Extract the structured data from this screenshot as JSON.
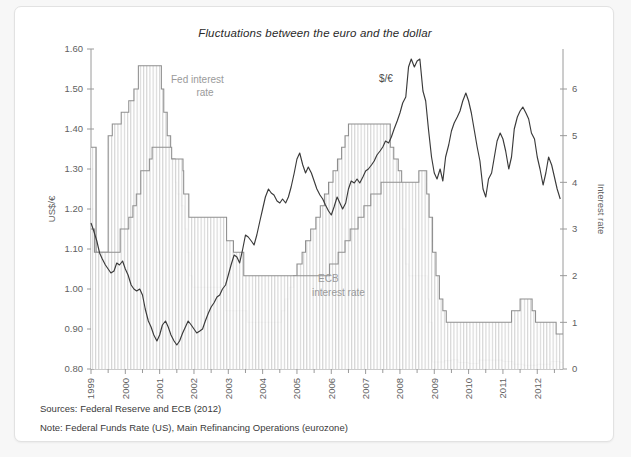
{
  "card": {
    "title": "Fluctuations between the euro and the dollar",
    "source_note": "Sources: Federal Reserve and ECB (2012)",
    "method_note": "Note: Federal Funds Rate (US), Main Refinancing Operations (eurozone)"
  },
  "annotations": {
    "fed_label_line1": "Fed interest",
    "fed_label_line2": "rate",
    "ecb_label_line1": "ECB",
    "ecb_label_line2": "interest rate",
    "fx_label": "$/€"
  },
  "chart_data": {
    "type": "line",
    "title": "Fluctuations between the euro and the dollar",
    "xlabel": "",
    "ylabel": "US$/€",
    "y2label": "Interest rate",
    "xlim": [
      1999.0,
      2012.75
    ],
    "ylim": [
      0.8,
      1.6
    ],
    "y2lim": [
      0,
      6
    ],
    "grid": false,
    "legend_position": "inline-annotations",
    "x_ticks": [
      "1999",
      "2000",
      "2001",
      "2002",
      "2003",
      "2004",
      "2005",
      "2006",
      "2007",
      "2008",
      "2009",
      "2010",
      "2011",
      "2012"
    ],
    "x_tick_values": [
      1999,
      2000,
      2001,
      2002,
      2003,
      2004,
      2005,
      2006,
      2007,
      2008,
      2009,
      2010,
      2011,
      2012
    ],
    "x_minor_ticks": [
      1999.5,
      2000.5,
      2001.5,
      2002.5,
      2003.5,
      2004.5,
      2005.5,
      2006.5,
      2007.5,
      2008.5,
      2009.5,
      2010.5,
      2011.5,
      2012.5
    ],
    "y_ticks": [
      "0.80",
      "0.90",
      "1.00",
      "1.10",
      "1.20",
      "1.30",
      "1.40",
      "1.50",
      "1.60"
    ],
    "y_tick_values": [
      0.8,
      0.9,
      1.0,
      1.1,
      1.2,
      1.3,
      1.4,
      1.5,
      1.6
    ],
    "y2_ticks": [
      "0",
      "1",
      "2",
      "3",
      "4",
      "5",
      "6"
    ],
    "y2_tick_values": [
      0,
      1,
      2,
      3,
      4,
      5,
      6
    ],
    "series": [
      {
        "name": "$/€ exchange rate",
        "axis": "left",
        "style": "line",
        "color": "#3a3a3a",
        "units": "US$ per euro",
        "x": [
          1999.0,
          1999.08,
          1999.17,
          1999.25,
          1999.33,
          1999.42,
          1999.5,
          1999.58,
          1999.67,
          1999.75,
          1999.83,
          1999.92,
          2000.0,
          2000.08,
          2000.17,
          2000.25,
          2000.33,
          2000.42,
          2000.5,
          2000.58,
          2000.67,
          2000.75,
          2000.83,
          2000.92,
          2001.0,
          2001.08,
          2001.17,
          2001.25,
          2001.33,
          2001.42,
          2001.5,
          2001.58,
          2001.67,
          2001.75,
          2001.83,
          2001.92,
          2002.0,
          2002.08,
          2002.17,
          2002.25,
          2002.33,
          2002.42,
          2002.5,
          2002.58,
          2002.67,
          2002.75,
          2002.83,
          2002.92,
          2003.0,
          2003.08,
          2003.17,
          2003.25,
          2003.33,
          2003.42,
          2003.5,
          2003.58,
          2003.67,
          2003.75,
          2003.83,
          2003.92,
          2004.0,
          2004.08,
          2004.17,
          2004.25,
          2004.33,
          2004.42,
          2004.5,
          2004.58,
          2004.67,
          2004.75,
          2004.83,
          2004.92,
          2005.0,
          2005.08,
          2005.17,
          2005.25,
          2005.33,
          2005.42,
          2005.5,
          2005.58,
          2005.67,
          2005.75,
          2005.83,
          2005.92,
          2006.0,
          2006.08,
          2006.17,
          2006.25,
          2006.33,
          2006.42,
          2006.5,
          2006.58,
          2006.67,
          2006.75,
          2006.83,
          2006.92,
          2007.0,
          2007.08,
          2007.17,
          2007.25,
          2007.33,
          2007.42,
          2007.5,
          2007.58,
          2007.67,
          2007.75,
          2007.83,
          2007.92,
          2008.0,
          2008.08,
          2008.17,
          2008.25,
          2008.33,
          2008.42,
          2008.5,
          2008.58,
          2008.67,
          2008.75,
          2008.83,
          2008.92,
          2009.0,
          2009.08,
          2009.17,
          2009.25,
          2009.33,
          2009.42,
          2009.5,
          2009.58,
          2009.67,
          2009.75,
          2009.83,
          2009.92,
          2010.0,
          2010.08,
          2010.17,
          2010.25,
          2010.33,
          2010.42,
          2010.5,
          2010.58,
          2010.67,
          2010.75,
          2010.83,
          2010.92,
          2011.0,
          2011.08,
          2011.17,
          2011.25,
          2011.33,
          2011.42,
          2011.5,
          2011.58,
          2011.67,
          2011.75,
          2011.83,
          2011.92,
          2012.0,
          2012.08,
          2012.17,
          2012.25,
          2012.33,
          2012.42,
          2012.5,
          2012.58,
          2012.67
        ],
        "y": [
          1.165,
          1.145,
          1.12,
          1.09,
          1.075,
          1.06,
          1.05,
          1.04,
          1.045,
          1.065,
          1.06,
          1.07,
          1.05,
          1.035,
          1.01,
          1.0,
          0.995,
          1.0,
          0.985,
          0.95,
          0.92,
          0.905,
          0.885,
          0.87,
          0.885,
          0.91,
          0.92,
          0.905,
          0.885,
          0.87,
          0.86,
          0.87,
          0.89,
          0.905,
          0.92,
          0.91,
          0.9,
          0.89,
          0.895,
          0.9,
          0.92,
          0.94,
          0.955,
          0.965,
          0.98,
          0.985,
          1.0,
          1.01,
          1.035,
          1.06,
          1.085,
          1.08,
          1.065,
          1.1,
          1.135,
          1.13,
          1.12,
          1.11,
          1.135,
          1.17,
          1.2,
          1.23,
          1.25,
          1.24,
          1.235,
          1.22,
          1.215,
          1.225,
          1.215,
          1.23,
          1.255,
          1.29,
          1.325,
          1.34,
          1.31,
          1.29,
          1.305,
          1.29,
          1.27,
          1.25,
          1.235,
          1.225,
          1.21,
          1.195,
          1.185,
          1.205,
          1.23,
          1.215,
          1.2,
          1.215,
          1.25,
          1.27,
          1.265,
          1.275,
          1.265,
          1.28,
          1.295,
          1.3,
          1.31,
          1.32,
          1.335,
          1.345,
          1.355,
          1.37,
          1.365,
          1.38,
          1.4,
          1.42,
          1.44,
          1.465,
          1.48,
          1.555,
          1.575,
          1.555,
          1.57,
          1.575,
          1.495,
          1.47,
          1.4,
          1.33,
          1.29,
          1.275,
          1.3,
          1.27,
          1.33,
          1.36,
          1.395,
          1.415,
          1.43,
          1.445,
          1.47,
          1.49,
          1.47,
          1.44,
          1.395,
          1.355,
          1.32,
          1.25,
          1.23,
          1.275,
          1.29,
          1.33,
          1.37,
          1.39,
          1.375,
          1.345,
          1.3,
          1.33,
          1.4,
          1.43,
          1.445,
          1.455,
          1.44,
          1.425,
          1.39,
          1.375,
          1.33,
          1.3,
          1.26,
          1.29,
          1.33,
          1.31,
          1.28,
          1.25,
          1.225
        ],
        "key_points": {
          "start_1999": 1.165,
          "trough_2001": 0.86,
          "trough_2000_late": 0.87,
          "peak_2008": 1.575,
          "dip_2008_late": 1.255,
          "peak_2009_late": 1.49,
          "dip_2010_mid": 1.23,
          "peak_2011_mid": 1.455,
          "end_2012": 1.225
        }
      },
      {
        "name": "Fed interest rate (Federal Funds Rate, US)",
        "axis": "right",
        "style": "step-area-hatched",
        "color": "#8e8e8e",
        "units": "percent",
        "steps": [
          {
            "x": 1999.0,
            "rate": 4.75
          },
          {
            "x": 1999.1,
            "rate": 4.75
          },
          {
            "x": 1999.15,
            "rate": 2.5
          },
          {
            "x": 1999.45,
            "rate": 2.5
          },
          {
            "x": 1999.5,
            "rate": 5.0
          },
          {
            "x": 1999.62,
            "rate": 5.25
          },
          {
            "x": 1999.88,
            "rate": 5.5
          },
          {
            "x": 2000.1,
            "rate": 5.75
          },
          {
            "x": 2000.25,
            "rate": 6.0
          },
          {
            "x": 2000.38,
            "rate": 6.5
          },
          {
            "x": 2001.0,
            "rate": 6.5
          },
          {
            "x": 2001.05,
            "rate": 6.0
          },
          {
            "x": 2001.12,
            "rate": 5.5
          },
          {
            "x": 2001.22,
            "rate": 5.0
          },
          {
            "x": 2001.32,
            "rate": 4.5
          },
          {
            "x": 2001.45,
            "rate": 4.0
          },
          {
            "x": 2001.5,
            "rate": 3.75
          },
          {
            "x": 2001.62,
            "rate": 3.5
          },
          {
            "x": 2001.72,
            "rate": 3.0
          },
          {
            "x": 2001.8,
            "rate": 2.5
          },
          {
            "x": 2001.88,
            "rate": 2.0
          },
          {
            "x": 2001.95,
            "rate": 1.75
          },
          {
            "x": 2002.9,
            "rate": 1.75
          },
          {
            "x": 2002.92,
            "rate": 1.25
          },
          {
            "x": 2003.5,
            "rate": 1.25
          },
          {
            "x": 2003.55,
            "rate": 1.0
          },
          {
            "x": 2004.5,
            "rate": 1.0
          },
          {
            "x": 2004.55,
            "rate": 1.25
          },
          {
            "x": 2004.65,
            "rate": 1.5
          },
          {
            "x": 2004.78,
            "rate": 1.75
          },
          {
            "x": 2004.9,
            "rate": 2.0
          },
          {
            "x": 2005.0,
            "rate": 2.25
          },
          {
            "x": 2005.15,
            "rate": 2.5
          },
          {
            "x": 2005.25,
            "rate": 2.75
          },
          {
            "x": 2005.4,
            "rate": 3.0
          },
          {
            "x": 2005.55,
            "rate": 3.25
          },
          {
            "x": 2005.68,
            "rate": 3.5
          },
          {
            "x": 2005.8,
            "rate": 3.75
          },
          {
            "x": 2005.92,
            "rate": 4.0
          },
          {
            "x": 2006.05,
            "rate": 4.25
          },
          {
            "x": 2006.18,
            "rate": 4.5
          },
          {
            "x": 2006.3,
            "rate": 4.75
          },
          {
            "x": 2006.4,
            "rate": 5.0
          },
          {
            "x": 2006.5,
            "rate": 5.25
          },
          {
            "x": 2007.68,
            "rate": 5.25
          },
          {
            "x": 2007.72,
            "rate": 4.75
          },
          {
            "x": 2007.82,
            "rate": 4.5
          },
          {
            "x": 2007.95,
            "rate": 4.25
          },
          {
            "x": 2008.05,
            "rate": 3.0
          },
          {
            "x": 2008.15,
            "rate": 2.25
          },
          {
            "x": 2008.25,
            "rate": 2.0
          },
          {
            "x": 2008.75,
            "rate": 2.0
          },
          {
            "x": 2008.8,
            "rate": 1.5
          },
          {
            "x": 2008.85,
            "rate": 1.0
          },
          {
            "x": 2008.95,
            "rate": 0.15
          },
          {
            "x": 2009.3,
            "rate": 0.18
          },
          {
            "x": 2009.5,
            "rate": 0.2
          },
          {
            "x": 2009.7,
            "rate": 0.14
          },
          {
            "x": 2010.0,
            "rate": 0.12
          },
          {
            "x": 2010.3,
            "rate": 0.19
          },
          {
            "x": 2010.6,
            "rate": 0.19
          },
          {
            "x": 2011.0,
            "rate": 0.16
          },
          {
            "x": 2011.3,
            "rate": 0.1
          },
          {
            "x": 2011.6,
            "rate": 0.08
          },
          {
            "x": 2012.0,
            "rate": 0.1
          },
          {
            "x": 2012.4,
            "rate": 0.16
          },
          {
            "x": 2012.67,
            "rate": 0.14
          }
        ],
        "key_points": {
          "start_1999": 4.75,
          "peak_2000_2001": 6.5,
          "trough_2003_2004": 1.0,
          "peak_2006_2007": 5.25,
          "floor_2009_2012": 0.15
        }
      },
      {
        "name": "ECB interest rate (Main Refinancing Operations, eurozone)",
        "axis": "right",
        "style": "step-area-hatched",
        "color": "#8e8e8e",
        "units": "percent",
        "steps": [
          {
            "x": 1999.0,
            "rate": 3.0
          },
          {
            "x": 1999.05,
            "rate": 3.0
          },
          {
            "x": 1999.1,
            "rate": 2.5
          },
          {
            "x": 1999.83,
            "rate": 2.5
          },
          {
            "x": 1999.85,
            "rate": 3.0
          },
          {
            "x": 2000.1,
            "rate": 3.25
          },
          {
            "x": 2000.22,
            "rate": 3.5
          },
          {
            "x": 2000.32,
            "rate": 3.75
          },
          {
            "x": 2000.45,
            "rate": 4.25
          },
          {
            "x": 2000.7,
            "rate": 4.5
          },
          {
            "x": 2000.78,
            "rate": 4.75
          },
          {
            "x": 2001.35,
            "rate": 4.5
          },
          {
            "x": 2001.68,
            "rate": 4.25
          },
          {
            "x": 2001.7,
            "rate": 3.75
          },
          {
            "x": 2001.85,
            "rate": 3.25
          },
          {
            "x": 2002.9,
            "rate": 3.25
          },
          {
            "x": 2002.95,
            "rate": 2.75
          },
          {
            "x": 2003.15,
            "rate": 2.5
          },
          {
            "x": 2003.45,
            "rate": 2.0
          },
          {
            "x": 2005.9,
            "rate": 2.0
          },
          {
            "x": 2005.95,
            "rate": 2.25
          },
          {
            "x": 2006.2,
            "rate": 2.5
          },
          {
            "x": 2006.4,
            "rate": 2.75
          },
          {
            "x": 2006.55,
            "rate": 3.0
          },
          {
            "x": 2006.78,
            "rate": 3.25
          },
          {
            "x": 2006.95,
            "rate": 3.5
          },
          {
            "x": 2007.15,
            "rate": 3.75
          },
          {
            "x": 2007.45,
            "rate": 4.0
          },
          {
            "x": 2008.5,
            "rate": 4.0
          },
          {
            "x": 2008.55,
            "rate": 4.25
          },
          {
            "x": 2008.78,
            "rate": 3.75
          },
          {
            "x": 2008.85,
            "rate": 3.25
          },
          {
            "x": 2008.95,
            "rate": 2.5
          },
          {
            "x": 2009.05,
            "rate": 2.0
          },
          {
            "x": 2009.15,
            "rate": 1.5
          },
          {
            "x": 2009.25,
            "rate": 1.25
          },
          {
            "x": 2009.35,
            "rate": 1.0
          },
          {
            "x": 2011.25,
            "rate": 1.25
          },
          {
            "x": 2011.5,
            "rate": 1.5
          },
          {
            "x": 2011.85,
            "rate": 1.25
          },
          {
            "x": 2011.95,
            "rate": 1.0
          },
          {
            "x": 2012.55,
            "rate": 0.75
          },
          {
            "x": 2012.67,
            "rate": 0.75
          }
        ],
        "key_points": {
          "start_1999": 3.0,
          "peak_2000_2001": 4.75,
          "trough_2003_2005": 2.0,
          "peak_2008": 4.25,
          "floor_2009_2011": 1.0,
          "bump_2011": 1.5,
          "end_2012": 0.75
        }
      }
    ]
  }
}
